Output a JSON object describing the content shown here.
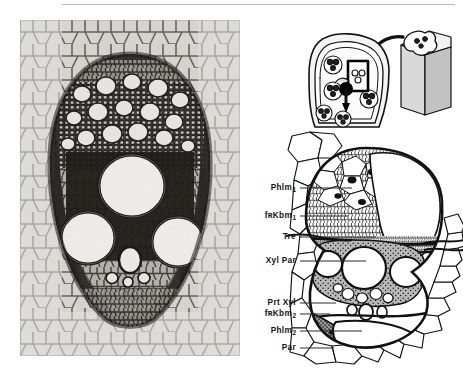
{
  "figure": {
    "title_rule": "horizontal-rule",
    "panels": {
      "photo": {
        "name": "light-micrograph-of-monocot-vascular-bundle",
        "description": "Transverse section light micrograph of a maize (Zea mays) stem vascular bundle showing three large metaxylem vessels, protoxylem lacuna, phloem and surrounding ground parenchyma"
      },
      "inset": {
        "name": "orientation-inset",
        "description": "Small schematic of whole stem cross-section with a boxed vascular bundle and a three-dimensional block showing the plane of section",
        "arrow": "curved-arrow-down-left"
      },
      "schematic": {
        "name": "labelled-schematic-of-vascular-bundle",
        "description": "Interpretive line drawing of the same vascular bundle with tissue labels"
      }
    }
  },
  "labels": [
    {
      "id": "phlm1",
      "text": "Phlm",
      "sub": "1",
      "x": 296,
      "y": 188,
      "leader_x": 300,
      "leader_w": 52
    },
    {
      "id": "fzkbm1",
      "text": "fʀKbm",
      "sub": "1",
      "x": 296,
      "y": 216,
      "leader_x": 300,
      "leader_w": 48
    },
    {
      "id": "tre",
      "text": "Tre",
      "sub": "",
      "x": 296,
      "y": 237,
      "leader_x": 300,
      "leader_w": 76
    },
    {
      "id": "xylpar",
      "text": "Xyl Par",
      "sub": "",
      "x": 296,
      "y": 261,
      "leader_x": 300,
      "leader_w": 66
    },
    {
      "id": "prtxyl",
      "text": "Prt Xyl",
      "sub": "",
      "x": 296,
      "y": 303,
      "leader_x": 300,
      "leader_w": 36
    },
    {
      "id": "fzkbm2",
      "text": "fʀKbm",
      "sub": "2",
      "x": 296,
      "y": 314,
      "leader_x": 300,
      "leader_w": 30
    },
    {
      "id": "phlm2",
      "text": "Phlm",
      "sub": "2",
      "x": 296,
      "y": 331,
      "leader_x": 300,
      "leader_w": 62
    },
    {
      "id": "par",
      "text": "Par",
      "sub": "",
      "x": 296,
      "y": 348,
      "leader_x": 300,
      "leader_w": 34
    }
  ],
  "label_glossary": {
    "Phlm1": "Phloem (first / outer)",
    "fzKbm1": "Fascicular cambium (first)",
    "Tre": "Trachea (metaxylem vessel)",
    "Xyl Par": "Xylem parenchyma",
    "Prt Xyl": "Protoxylem",
    "fzKbm2": "Fascicular cambium (second)",
    "Phlm2": "Phloem (second / inner)",
    "Par": "Parenchyma"
  },
  "colors": {
    "ink": "#111111",
    "leader": "#2a2a2a",
    "rule": "#b9b9b9",
    "shade_mid": "#9a9a9a",
    "shade_dark": "#5e5e5e",
    "paper": "#ffffff"
  }
}
